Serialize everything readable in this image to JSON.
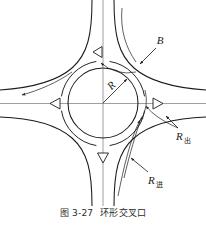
{
  "figure": {
    "caption_number": "图 3-27",
    "caption_title": "环形交叉口",
    "colors": {
      "road_edge": "#1a1a1a",
      "center_line": "#6b6b6b",
      "flow_arrow": "#2a2a2a",
      "label_text": "#1a1a1a",
      "background": "#ffffff"
    }
  },
  "labels": {
    "width_label": "B",
    "radius_label": "R",
    "exit_radius_base": "R",
    "exit_radius_sub": "出",
    "entry_radius_base": "R",
    "entry_radius_sub": "进"
  },
  "diagram_data": {
    "type": "diagram",
    "subject": "roundabout-intersection",
    "center": {
      "x": 103,
      "y": 103
    },
    "central_island_radius": 35,
    "circulating_lane_radius": 42,
    "approach_count": 4,
    "approach_directions": [
      "north",
      "east",
      "south",
      "west"
    ],
    "direction_triangles": [
      {
        "name": "north-triangle",
        "points_to": "left",
        "x": 100,
        "y": 52
      },
      {
        "name": "east-triangle",
        "points_to": "right",
        "x": 155,
        "y": 104
      },
      {
        "name": "west-triangle",
        "points_to": "left",
        "x": 58,
        "y": 104
      },
      {
        "name": "south-triangle",
        "points_to": "down",
        "x": 103,
        "y": 155
      }
    ],
    "flow_direction": "counter-clockwise",
    "leader_lines": [
      {
        "label": "B",
        "target": "road-width-northeast"
      },
      {
        "label": "R",
        "target": "central-island-edge"
      },
      {
        "label": "R出",
        "target": "exit-corner-curve"
      },
      {
        "label": "R进",
        "target": "entry-corner-curve"
      }
    ]
  }
}
